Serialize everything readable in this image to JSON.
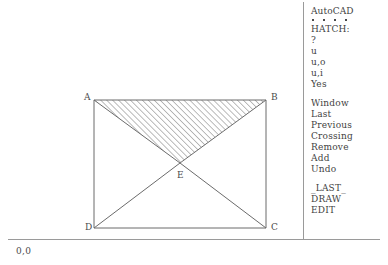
{
  "application": {
    "name": "AutoCAD",
    "command_prompt": "HATCH:"
  },
  "side_menu": {
    "title": "AutoCAD",
    "dots_count": 4,
    "header": "HATCH:",
    "pattern_options": [
      "?",
      "u",
      "u,o",
      "u,i",
      "Yes"
    ],
    "selection_options": [
      "Window",
      "Last",
      "Previous",
      "Crossing",
      "Remove",
      "Add",
      "Undo"
    ],
    "navigation_options": [
      "_LAST_",
      "DRAW",
      "EDIT"
    ]
  },
  "drawing": {
    "origin_label": "0,0",
    "vertices": [
      {
        "id": "A",
        "label": "A",
        "x": 94,
        "y": 100
      },
      {
        "id": "B",
        "label": "B",
        "x": 266,
        "y": 100
      },
      {
        "id": "C",
        "label": "C",
        "x": 266,
        "y": 228
      },
      {
        "id": "D",
        "label": "D",
        "x": 94,
        "y": 228
      },
      {
        "id": "E",
        "label": "E",
        "x": 180,
        "y": 163
      }
    ],
    "hatched_region": "A-B-E",
    "unhatched_region": "D-E-C",
    "line_color": "#6b6b6b",
    "hatch_color": "#6b6b6b"
  }
}
